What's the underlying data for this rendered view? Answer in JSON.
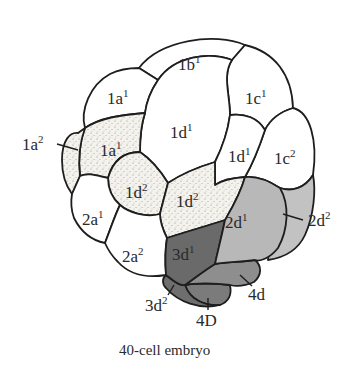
{
  "figure": {
    "caption": "40-cell embryo",
    "colors": {
      "white": "#ffffff",
      "stippled": "#f2f0ea",
      "light_gray": "#bdbdbd",
      "mid_gray": "#8e8e8e",
      "dark_gray": "#6a6a6a",
      "outline": "#1e1e1e"
    },
    "cells": [
      {
        "id": "1b1",
        "base": "1b",
        "sup": "1",
        "fill": "white"
      },
      {
        "id": "1a1-outer",
        "base": "1a",
        "sup": "1",
        "fill": "white"
      },
      {
        "id": "1c1",
        "base": "1c",
        "sup": "1",
        "fill": "white"
      },
      {
        "id": "1d1-center",
        "base": "1d",
        "sup": "1",
        "fill": "white"
      },
      {
        "id": "1a1-inner",
        "base": "1a",
        "sup": "1",
        "fill": "stippled"
      },
      {
        "id": "1d1-right",
        "base": "1d",
        "sup": "1",
        "fill": "white"
      },
      {
        "id": "1c2",
        "base": "1c",
        "sup": "2",
        "fill": "white"
      },
      {
        "id": "1d2-left",
        "base": "1d",
        "sup": "2",
        "fill": "stippled"
      },
      {
        "id": "1d2-right",
        "base": "1d",
        "sup": "2",
        "fill": "stippled"
      },
      {
        "id": "2a1",
        "base": "2a",
        "sup": "1",
        "fill": "white"
      },
      {
        "id": "2a2",
        "base": "2a",
        "sup": "2",
        "fill": "white"
      },
      {
        "id": "2d1",
        "base": "2d",
        "sup": "1",
        "fill": "light_gray"
      },
      {
        "id": "3d1",
        "base": "3d",
        "sup": "1",
        "fill": "dark_gray"
      }
    ],
    "callouts": [
      {
        "id": "1a2",
        "base": "1a",
        "sup": "2"
      },
      {
        "id": "2d2",
        "base": "2d",
        "sup": "2"
      },
      {
        "id": "3d2",
        "base": "3d",
        "sup": "2"
      },
      {
        "id": "4D",
        "base": "4D",
        "sup": ""
      },
      {
        "id": "4d",
        "base": "4d",
        "sup": ""
      }
    ]
  }
}
